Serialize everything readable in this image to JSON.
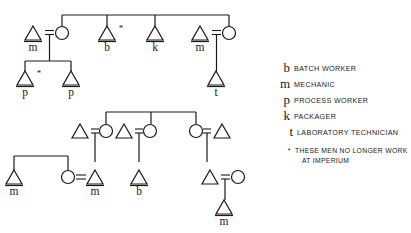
{
  "figure": {
    "type": "kinship-diagram",
    "background_color": "#ffffff",
    "ink_color": "#1a1a1a",
    "symbols": {
      "male": "triangle",
      "female": "circle",
      "marriage": "equals-sign",
      "descent": "vertical-line",
      "sibling": "horizontal-bar",
      "no-longer-employed": "asterisk"
    }
  },
  "legend": {
    "entries": [
      {
        "key": "b",
        "description": "BATCH WORKER"
      },
      {
        "key": "m",
        "description": "MECHANIC"
      },
      {
        "key": "p",
        "description": "PROCESS WORKER"
      },
      {
        "key": "k",
        "description": "PACKAGER"
      },
      {
        "key": "t",
        "description": "LABORATORY TECHNICIAN"
      }
    ],
    "footnote": {
      "marker": "*",
      "line1": "THESE MEN NO LONGER WORK",
      "line2": "AT IMPERIUM"
    }
  },
  "diagram_top": {
    "name": "upper-family-tree",
    "nodes": [
      {
        "id": "t1-m",
        "sex": "male",
        "role": "m",
        "star": false,
        "x": 33,
        "y": 33
      },
      {
        "id": "t1-wife",
        "sex": "female",
        "role": "",
        "star": false,
        "x": 62,
        "y": 33
      },
      {
        "id": "t1-b",
        "sex": "male",
        "role": "b",
        "star": true,
        "x": 107,
        "y": 33
      },
      {
        "id": "t1-k",
        "sex": "male",
        "role": "k",
        "star": false,
        "x": 155,
        "y": 33
      },
      {
        "id": "t1-m2",
        "sex": "male",
        "role": "m",
        "star": false,
        "x": 200,
        "y": 33
      },
      {
        "id": "t1-wife2",
        "sex": "female",
        "role": "",
        "star": false,
        "x": 229,
        "y": 33
      },
      {
        "id": "t2-p-star",
        "sex": "male",
        "role": "p",
        "star": true,
        "x": 25,
        "y": 78
      },
      {
        "id": "t2-p",
        "sex": "male",
        "role": "p",
        "star": false,
        "x": 71,
        "y": 78
      },
      {
        "id": "t2-t",
        "sex": "male",
        "role": "t",
        "star": false,
        "x": 215,
        "y": 78
      }
    ]
  },
  "diagram_bottom": {
    "name": "lower-family-tree",
    "nodes": [
      {
        "id": "b1-h1",
        "sex": "male",
        "role": "",
        "star": false,
        "x": 80,
        "y": 131
      },
      {
        "id": "b1-w1",
        "sex": "female",
        "role": "",
        "star": false,
        "x": 106,
        "y": 131
      },
      {
        "id": "b1-h2",
        "sex": "male",
        "role": "",
        "star": false,
        "x": 124,
        "y": 131
      },
      {
        "id": "b1-w2",
        "sex": "female",
        "role": "",
        "star": false,
        "x": 150,
        "y": 131
      },
      {
        "id": "b1-w3",
        "sex": "female",
        "role": "",
        "star": false,
        "x": 196,
        "y": 131
      },
      {
        "id": "b1-h3",
        "sex": "male",
        "role": "",
        "star": false,
        "x": 222,
        "y": 131
      },
      {
        "id": "b2-m1",
        "sex": "male",
        "role": "m",
        "star": false,
        "x": 14,
        "y": 177
      },
      {
        "id": "b2-w",
        "sex": "female",
        "role": "",
        "star": false,
        "x": 68,
        "y": 177
      },
      {
        "id": "b2-m2",
        "sex": "male",
        "role": "m",
        "star": false,
        "x": 95,
        "y": 177
      },
      {
        "id": "b2-b",
        "sex": "male",
        "role": "b",
        "star": false,
        "x": 139,
        "y": 177
      },
      {
        "id": "b2-h",
        "sex": "male",
        "role": "",
        "star": false,
        "x": 210,
        "y": 177
      },
      {
        "id": "b2-w2",
        "sex": "female",
        "role": "",
        "star": false,
        "x": 238,
        "y": 177
      },
      {
        "id": "b3-m",
        "sex": "male",
        "role": "m",
        "star": false,
        "x": 224,
        "y": 215
      }
    ]
  }
}
